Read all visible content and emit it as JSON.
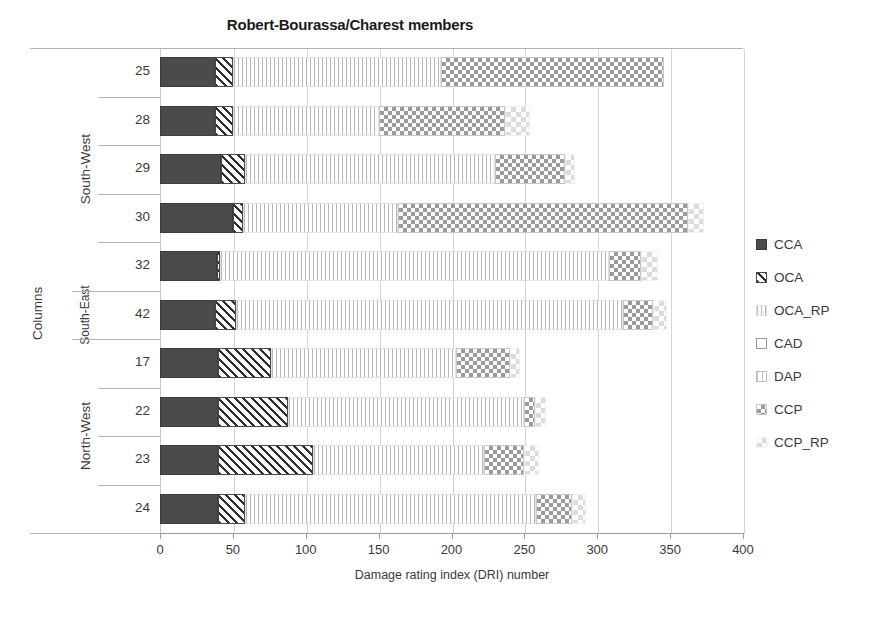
{
  "chart_data": {
    "type": "bar",
    "orientation": "horizontal",
    "stacked": true,
    "title": "Robert-Bourassa/Charest members",
    "xlabel": "Damage rating index (DRI) number",
    "ylabel": "Columns",
    "xlim": [
      0,
      400
    ],
    "xticks": [
      0,
      50,
      100,
      150,
      200,
      250,
      300,
      350,
      400
    ],
    "grid": "vertical",
    "legend_position": "right",
    "categories": [
      "25",
      "28",
      "29",
      "30",
      "32",
      "42",
      "17",
      "22",
      "23",
      "24"
    ],
    "groups": [
      {
        "name": "South-West",
        "categories": [
          "25",
          "28",
          "29",
          "30",
          "32"
        ]
      },
      {
        "name": "South-East",
        "categories": [
          "42"
        ]
      },
      {
        "name": "North-West",
        "categories": [
          "17",
          "22",
          "23",
          "24"
        ]
      }
    ],
    "series": [
      {
        "name": "CCA",
        "values": [
          38,
          38,
          42,
          50,
          39,
          38,
          40,
          40,
          40,
          40
        ]
      },
      {
        "name": "OCA",
        "values": [
          12,
          12,
          16,
          7,
          2,
          14,
          36,
          48,
          65,
          18
        ]
      },
      {
        "name": "OCA_RP",
        "values": [
          143,
          100,
          172,
          106,
          267,
          266,
          127,
          162,
          117,
          200
        ]
      },
      {
        "name": "CAD",
        "values": [
          0,
          0,
          0,
          0,
          0,
          0,
          0,
          0,
          0,
          0
        ]
      },
      {
        "name": "DAP",
        "values": [
          0,
          0,
          0,
          0,
          0,
          0,
          0,
          0,
          0,
          0
        ]
      },
      {
        "name": "CCP",
        "values": [
          153,
          87,
          48,
          199,
          22,
          20,
          37,
          7,
          28,
          25
        ]
      },
      {
        "name": "CCP_RP",
        "values": [
          0,
          17,
          7,
          11,
          12,
          10,
          7,
          8,
          10,
          9
        ]
      }
    ],
    "totals": [
      346,
      254,
      285,
      373,
      342,
      348,
      247,
      265,
      260,
      292
    ]
  },
  "legend": {
    "items": [
      {
        "label": "CCA",
        "swatch": "solid-dark-swatch"
      },
      {
        "label": "OCA",
        "swatch": "diagonal-hatch-swatch"
      },
      {
        "label": "OCA_RP",
        "swatch": "vertical-line-swatch"
      },
      {
        "label": "CAD",
        "swatch": "empty-outline-swatch"
      },
      {
        "label": "DAP",
        "swatch": "grid-dot-swatch"
      },
      {
        "label": "CCP",
        "swatch": "checker-swatch"
      },
      {
        "label": "CCP_RP",
        "swatch": "light-checker-swatch"
      }
    ]
  },
  "colors": {
    "CCA": "#4b4b4b",
    "OCA": "#2f2f2f",
    "OCA_RP": "#b9b9b9",
    "CAD": "#ffffff",
    "DAP": "#c4c4c4",
    "CCP": "#9b9b9b",
    "CCP_RP": "#dcdcdc",
    "axis": "#9a9a9a",
    "grid": "#d4d4d4",
    "text": "#3a3a3a"
  }
}
